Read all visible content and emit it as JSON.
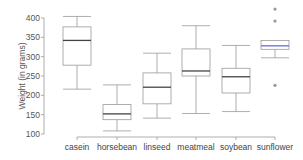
{
  "chart_data": {
    "type": "box",
    "title": "",
    "xlabel": "",
    "ylabel": "Weight (in grams)",
    "ylim": [
      100,
      400
    ],
    "yticks": [
      100,
      150,
      200,
      250,
      300,
      350,
      400
    ],
    "grid": false,
    "categories": [
      "casein",
      "horsebean",
      "linseed",
      "meatmeal",
      "soybean",
      "sunflower"
    ],
    "series": [
      {
        "name": "casein",
        "whisker_low": 216,
        "q1": 278,
        "median": 342,
        "q3": 377,
        "whisker_high": 404,
        "outliers": []
      },
      {
        "name": "horsebean",
        "whisker_low": 108,
        "q1": 137,
        "median": 152,
        "q3": 176,
        "whisker_high": 227,
        "outliers": []
      },
      {
        "name": "linseed",
        "whisker_low": 141,
        "q1": 178,
        "median": 221,
        "q3": 258,
        "whisker_high": 309,
        "outliers": []
      },
      {
        "name": "meatmeal",
        "whisker_low": 153,
        "q1": 250,
        "median": 263,
        "q3": 320,
        "whisker_high": 380,
        "outliers": []
      },
      {
        "name": "soybean",
        "whisker_low": 158,
        "q1": 206,
        "median": 248,
        "q3": 270,
        "whisker_high": 329,
        "outliers": []
      },
      {
        "name": "sunflower",
        "whisker_low": 297,
        "q1": 319,
        "median": 328,
        "q3": 342,
        "whisker_high": 342,
        "outliers": [
          226,
          392,
          423
        ],
        "highlight": true
      }
    ],
    "colors": {
      "box": "#999999",
      "median": "#444444",
      "highlight_median": "#6a6ae0",
      "outlier": "#999999",
      "axis": "#999999"
    }
  }
}
